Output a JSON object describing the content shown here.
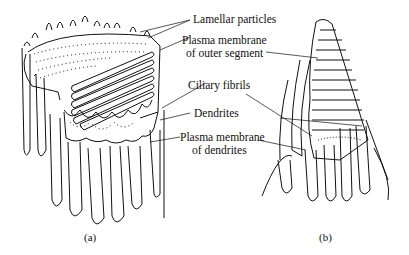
{
  "figure": {
    "labels": {
      "lamellar_particles": "Lamellar particles",
      "plasma_membrane_outer_1": "Plasma membrane",
      "plasma_membrane_outer_2": "of outer segment",
      "ciliary_fibrils": "Ciliary fibrils",
      "dendrites": "Dendrites",
      "plasma_membrane_dendrites_1": "Plasma membrane",
      "plasma_membrane_dendrites_2": "of dendrites"
    },
    "captions": {
      "a": "(a)",
      "b": "(b)"
    }
  },
  "colors": {
    "ink": "#111111",
    "background": "#ffffff"
  }
}
